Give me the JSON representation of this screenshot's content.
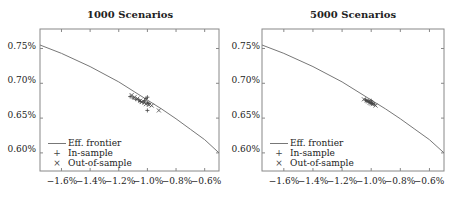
{
  "chart_data": [
    {
      "type": "scatter",
      "title": "1000 Scenarios",
      "xlabel": "",
      "ylabel": "",
      "xlim": [
        -1.75,
        -0.5
      ],
      "ylim": [
        0.574,
        0.778
      ],
      "x_ticks": [
        "−1.6%",
        "−1.4%",
        "−1.2%",
        "−1.0%",
        "−0.8%",
        "−0.6%"
      ],
      "y_ticks": [
        "0.75%",
        "0.70%",
        "0.65%",
        "0.60%"
      ],
      "grid": false,
      "legend_position": "lower left",
      "legend": [
        "Eff. frontier",
        "In-sample",
        "Out-of-sample"
      ],
      "series": [
        {
          "name": "Eff. frontier",
          "kind": "line",
          "x": [
            -1.75,
            -1.6,
            -1.4,
            -1.2,
            -1.0,
            -0.9,
            -0.8,
            -0.7,
            -0.6,
            -0.5
          ],
          "y": [
            0.755,
            0.743,
            0.724,
            0.702,
            0.676,
            0.663,
            0.649,
            0.634,
            0.619,
            0.6
          ]
        },
        {
          "name": "In-sample",
          "kind": "plus",
          "x": [
            -1.12,
            -1.1,
            -1.08,
            -1.06,
            -1.05,
            -1.03,
            -1.02,
            -1.01,
            -1.0,
            -1.0,
            -0.99,
            -1.0
          ],
          "y": [
            0.681,
            0.679,
            0.677,
            0.676,
            0.674,
            0.673,
            0.675,
            0.678,
            0.68,
            0.672,
            0.671,
            0.661
          ]
        },
        {
          "name": "Out-of-sample",
          "kind": "cross",
          "x": [
            -1.11,
            -1.09,
            -1.07,
            -1.05,
            -1.04,
            -1.02,
            -1.01,
            -0.99,
            -0.97,
            -0.92
          ],
          "y": [
            0.683,
            0.68,
            0.678,
            0.675,
            0.673,
            0.672,
            0.67,
            0.669,
            0.668,
            0.661
          ]
        }
      ]
    },
    {
      "type": "scatter",
      "title": "5000 Scenarios",
      "xlabel": "",
      "ylabel": "",
      "xlim": [
        -1.75,
        -0.5
      ],
      "ylim": [
        0.574,
        0.778
      ],
      "x_ticks": [
        "−1.6%",
        "−1.4%",
        "−1.2%",
        "−1.0%",
        "−0.8%",
        "−0.6%"
      ],
      "y_ticks": [
        "0.75%",
        "0.70%",
        "0.65%",
        "0.60%"
      ],
      "grid": false,
      "legend_position": "lower left",
      "legend": [
        "Eff. frontier",
        "In-sample",
        "Out-of-sample"
      ],
      "series": [
        {
          "name": "Eff. frontier",
          "kind": "line",
          "x": [
            -1.75,
            -1.6,
            -1.4,
            -1.2,
            -1.0,
            -0.9,
            -0.8,
            -0.7,
            -0.6,
            -0.5
          ],
          "y": [
            0.755,
            0.743,
            0.724,
            0.702,
            0.676,
            0.663,
            0.649,
            0.634,
            0.619,
            0.6
          ]
        },
        {
          "name": "In-sample",
          "kind": "plus",
          "x": [
            -1.04,
            -1.03,
            -1.02,
            -1.01,
            -1.0,
            -0.99,
            -0.98,
            -1.0
          ],
          "y": [
            0.676,
            0.675,
            0.674,
            0.673,
            0.672,
            0.671,
            0.67,
            0.675
          ]
        },
        {
          "name": "Out-of-sample",
          "kind": "cross",
          "x": [
            -1.05,
            -1.03,
            -1.02,
            -1.01,
            -1.0,
            -0.99,
            -0.97
          ],
          "y": [
            0.677,
            0.675,
            0.674,
            0.672,
            0.671,
            0.67,
            0.668
          ]
        }
      ]
    }
  ],
  "panels": [
    {
      "title": "1000 Scenarios"
    },
    {
      "title": "5000 Scenarios"
    }
  ],
  "legend": {
    "frontier": "Eff. frontier",
    "in_sample": "In-sample",
    "out_sample": "Out-of-sample",
    "plus_glyph": "+",
    "cross_glyph": "×"
  },
  "colors": {
    "axis": "#888888",
    "line": "#777777",
    "marker": "#444444"
  }
}
